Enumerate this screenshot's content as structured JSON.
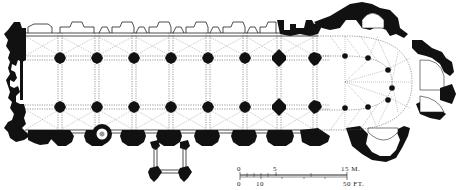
{
  "figure": {
    "type": "architectural floor plan"
  },
  "scale_bar": {
    "metric": {
      "ticks": [
        "0",
        "5",
        "15 M."
      ]
    },
    "imperial": {
      "ticks": [
        "0",
        "10",
        "50 FT."
      ]
    }
  },
  "colors": {
    "ink": "#111111",
    "background": "#ffffff",
    "vault_lines": "#555555"
  }
}
